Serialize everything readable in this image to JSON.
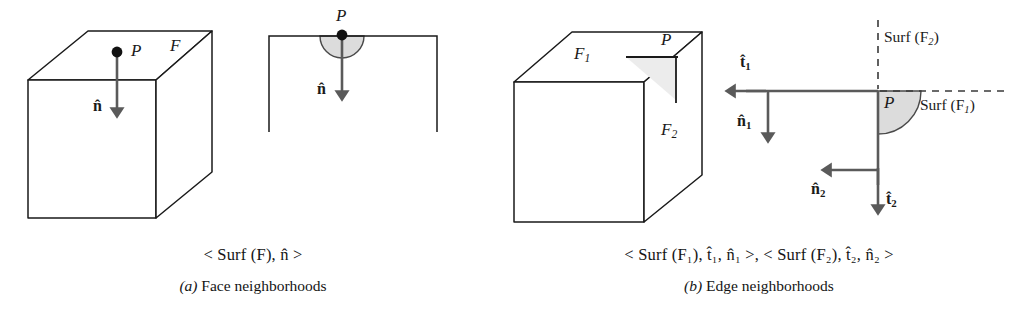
{
  "figure": {
    "width": 1012,
    "height": 317,
    "background": "#ffffff",
    "stroke_color": "#1a1a1a",
    "arrow_color": "#555555",
    "shade_color": "#d9d9d9"
  },
  "panel_a": {
    "name": "Face neighborhoods",
    "caption_formula": "< Surf (F), n̂ >",
    "caption_label": "(a) Face neighborhoods",
    "caption_label_prefix": "(a)",
    "caption_label_text": "Face neighborhoods",
    "cube": {
      "face_label": "F",
      "point_label": "P",
      "normal_label": "n̂"
    },
    "detail": {
      "point_label": "P",
      "normal_label": "n̂",
      "shape": "half-disk-below-surface"
    }
  },
  "panel_b": {
    "name": "Edge neighborhoods",
    "caption_formula": "< Surf (F₁), t̂₁, n̂₁ >, < Surf (F₂), t̂₂, n̂₂ >",
    "caption_label": "(b) Edge neighborhoods",
    "caption_label_prefix": "(b)",
    "caption_label_text": "Edge neighborhoods",
    "cube": {
      "top_face_label": "F",
      "top_face_sub": "1",
      "right_face_label": "F",
      "right_face_sub": "2",
      "point_label": "P"
    },
    "detail": {
      "point_label": "P",
      "surf_f2_label": "Surf (F",
      "surf_f2_sub": "2",
      "surf_f1_label": "Surf (F",
      "surf_f1_sub": "1",
      "vectors": [
        {
          "id": "t1",
          "glyph": "t̂",
          "sub": "1",
          "direction": "left"
        },
        {
          "id": "n1",
          "glyph": "n̂",
          "sub": "1",
          "direction": "down"
        },
        {
          "id": "n2",
          "glyph": "n̂",
          "sub": "2",
          "direction": "left"
        },
        {
          "id": "t2",
          "glyph": "t̂",
          "sub": "2",
          "direction": "down"
        }
      ],
      "shape": "quarter-disk-at-edge"
    }
  }
}
